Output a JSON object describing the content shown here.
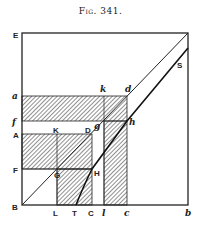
{
  "figure": {
    "caption": "Fig. 341.",
    "labels": {
      "E": "E",
      "S": "S",
      "a": "a",
      "k": "k",
      "d": "d",
      "f": "f",
      "h": "h",
      "A": "A",
      "K": "K",
      "D": "D",
      "g": "g",
      "F": "F",
      "G": "G",
      "H": "H",
      "B": "B",
      "L": "L",
      "T": "T",
      "C": "C",
      "l": "l",
      "c": "c",
      "b": "b"
    },
    "colors": {
      "ink": "#222222",
      "background": "#ffffff"
    }
  }
}
